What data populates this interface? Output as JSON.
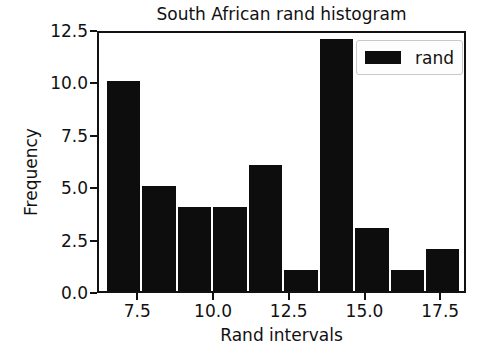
{
  "chart_data": {
    "type": "bar",
    "title": "South African rand histogram",
    "xlabel": "Rand intervals",
    "ylabel": "Frequency",
    "legend": [
      {
        "label": "rand",
        "color": "#0d0d0d"
      }
    ],
    "legend_position": "upper right",
    "grid": false,
    "xlim": [
      6.17,
      18.35
    ],
    "ylim": [
      0,
      12.5
    ],
    "xticks": [
      7.5,
      10.0,
      12.5,
      15.0,
      17.5
    ],
    "xtick_labels": [
      "7.5",
      "10.0",
      "12.5",
      "15.0",
      "17.5"
    ],
    "yticks": [
      0.0,
      2.5,
      5.0,
      7.5,
      10.0,
      12.5
    ],
    "ytick_labels": [
      "0.0",
      "2.5",
      "5.0",
      "7.5",
      "10.0",
      "12.5"
    ],
    "bin_edges": [
      6.4,
      7.57,
      8.74,
      9.91,
      11.08,
      12.25,
      13.42,
      14.59,
      15.76,
      16.93,
      18.1
    ],
    "categories": [
      "6.40-7.57",
      "7.57-8.74",
      "8.74-9.91",
      "9.91-11.08",
      "11.08-12.25",
      "12.25-13.42",
      "13.42-14.59",
      "14.59-15.76",
      "15.76-16.93",
      "16.93-18.10"
    ],
    "values": [
      10,
      5,
      4,
      4,
      6,
      1,
      12,
      3,
      1,
      2
    ],
    "bar_color": "#0d0d0d",
    "background_color": "#ffffff",
    "axes_color": "#121212"
  }
}
